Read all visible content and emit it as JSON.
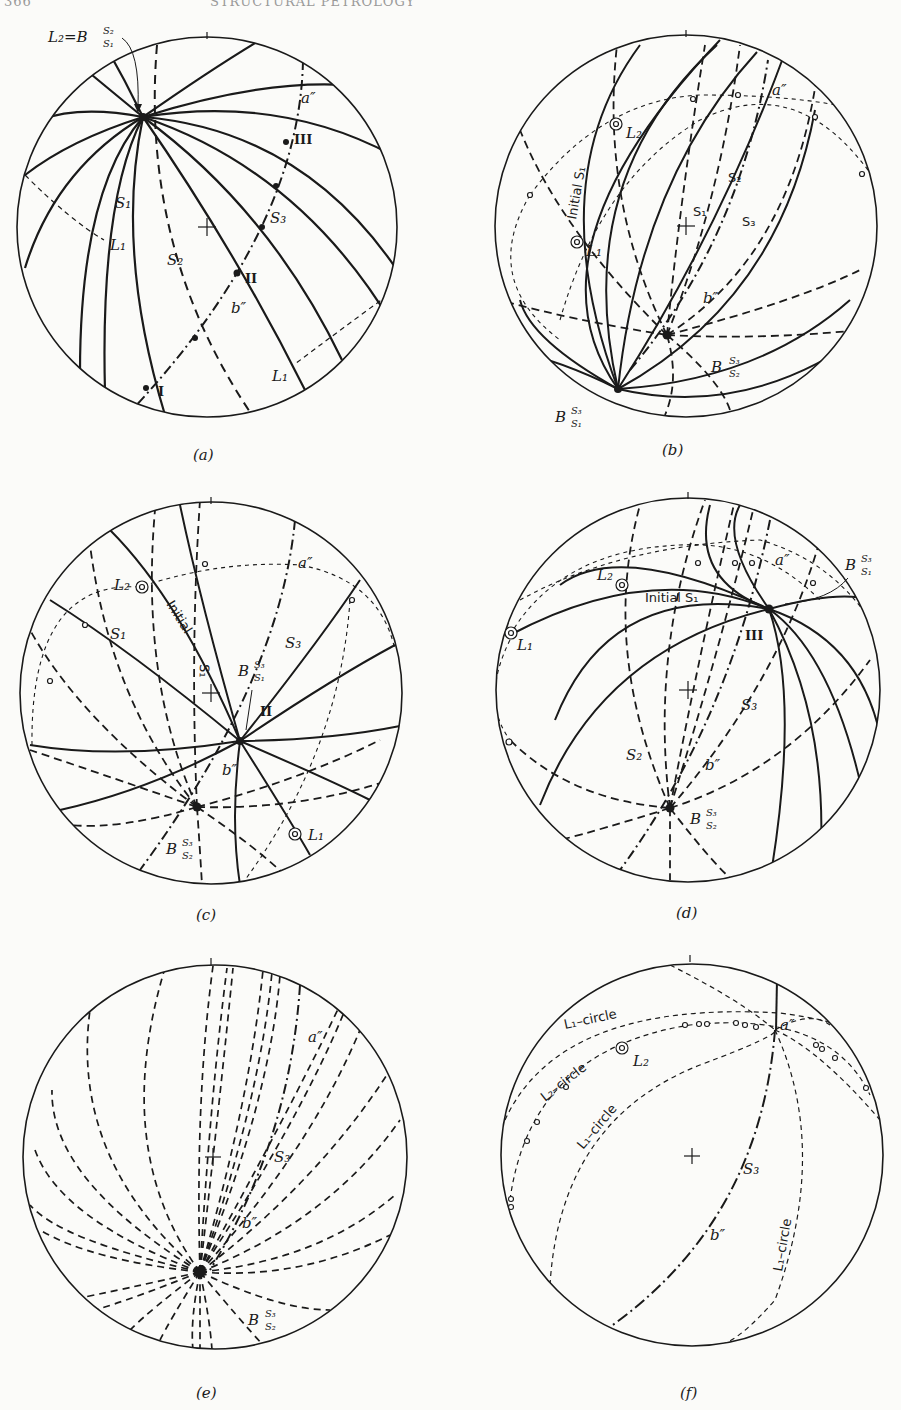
{
  "page": {
    "running_head_left": "366",
    "running_head_center": "STRUCTURAL PETROLOGY"
  },
  "figures": [
    {
      "id": "a",
      "caption": "(a)",
      "center": [
        207,
        227
      ],
      "radius": 190,
      "labels": {
        "l2_eq_b": "L₂=B",
        "l2_sup": "S₂",
        "l2_sub": "S₁",
        "s1": "S₁",
        "s2": "S₂",
        "s3": "S₃",
        "l1_left": "L₁",
        "l1_right": "L₁",
        "a_dd": "a″",
        "b_dd": "b″",
        "roman_1": "I",
        "roman_2": "II",
        "roman_3": "III"
      }
    },
    {
      "id": "b",
      "caption": "(b)",
      "center": [
        686,
        226
      ],
      "radius": 191,
      "labels": {
        "initial_s1": "Initial S₁",
        "l1": "L₁",
        "l2": "L₂",
        "s1": "S₁",
        "s2": "S₂",
        "s3": "S₃",
        "a_dd": "a″",
        "b_dd": "b″",
        "b_s3_s2": "B",
        "b_s3_s2_sup": "S₃",
        "b_s3_s2_sub": "S₂",
        "b_s3_s1": "B",
        "b_s3_s1_sup": "S₃",
        "b_s3_s1_sub": "S₁"
      }
    },
    {
      "id": "c",
      "caption": "(c)",
      "center": [
        211,
        693
      ],
      "radius": 191,
      "labels": {
        "initial": "Initial",
        "l1": "L₁",
        "l2": "L₂",
        "s1": "S₁",
        "s1_rot": "S₁",
        "s3": "S₃",
        "a_dd": "a″",
        "b_dd": "b″",
        "roman_2": "II",
        "b_s3_s1": "B",
        "b_s3_s1_sup": "S₃",
        "b_s3_s1_sub": "S₁",
        "b_s3_s2": "B",
        "b_s3_s2_sup": "S₃",
        "b_s3_s2_sub": "S₂"
      }
    },
    {
      "id": "d",
      "caption": "(d)",
      "center": [
        688,
        690
      ],
      "radius": 192,
      "labels": {
        "initial_s1": "Initial S₁",
        "l1": "L₁",
        "l2": "L₂",
        "s2": "S₂",
        "s3": "S₃",
        "a_dd": "a″",
        "b_dd": "b″",
        "roman_3": "III",
        "b_s3_s1": "B",
        "b_s3_s1_sup": "S₃",
        "b_s3_s1_sub": "S₁",
        "b_s3_s2": "B",
        "b_s3_s2_sup": "S₃",
        "b_s3_s2_sub": "S₂"
      }
    },
    {
      "id": "e",
      "caption": "(e)",
      "center": [
        215,
        1157
      ],
      "radius": 192,
      "labels": {
        "s3": "S₃",
        "a_dd": "a″",
        "b_dd": "b″",
        "b_s3_s2": "B",
        "b_s3_s2_sup": "S₃",
        "b_s3_s2_sub": "S₂"
      }
    },
    {
      "id": "f",
      "caption": "(f)",
      "center": [
        692,
        1155
      ],
      "radius": 191,
      "labels": {
        "l1_circle_top": "L₁–circle",
        "l2_circle": "L₂–circle",
        "l1_circle_mid": "L₁–circle",
        "l1_circle_right": "L₁–circle",
        "l2": "L₂",
        "s3": "S₃",
        "a_dd": "a″",
        "b_dd": "b″"
      }
    }
  ]
}
